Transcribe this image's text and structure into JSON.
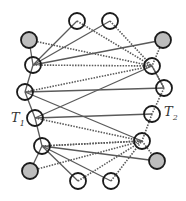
{
  "diagram": {
    "labels": {
      "t1": {
        "main": "T",
        "sub": "1"
      },
      "t2": {
        "main": "T",
        "sub": "2"
      }
    },
    "colors": {
      "stroke": "#1a1a1a",
      "edge": "#5a5a5a",
      "fill_hatched": "#bdbdbd",
      "fill_plain": "#ffffff"
    },
    "nodes": [
      {
        "id": "tl",
        "x": 29,
        "y": 40,
        "filled": true
      },
      {
        "id": "top1",
        "x": 77,
        "y": 21,
        "filled": false
      },
      {
        "id": "top2",
        "x": 110,
        "y": 21,
        "filled": false
      },
      {
        "id": "tr",
        "x": 163,
        "y": 40,
        "filled": true
      },
      {
        "id": "L1",
        "x": 33,
        "y": 65,
        "filled": false
      },
      {
        "id": "R1",
        "x": 152,
        "y": 66,
        "filled": false
      },
      {
        "id": "L2",
        "x": 25,
        "y": 92,
        "filled": false
      },
      {
        "id": "R2",
        "x": 164,
        "y": 88,
        "filled": false
      },
      {
        "id": "T1",
        "x": 35,
        "y": 118,
        "filled": false
      },
      {
        "id": "T2",
        "x": 152,
        "y": 114,
        "filled": false
      },
      {
        "id": "L3",
        "x": 42,
        "y": 146,
        "filled": false
      },
      {
        "id": "R3",
        "x": 142,
        "y": 141,
        "filled": false
      },
      {
        "id": "bl",
        "x": 30,
        "y": 171,
        "filled": true
      },
      {
        "id": "br",
        "x": 157,
        "y": 161,
        "filled": true
      },
      {
        "id": "bot1",
        "x": 78,
        "y": 181,
        "filled": false
      },
      {
        "id": "bot2",
        "x": 111,
        "y": 181,
        "filled": false
      }
    ],
    "solid_edges": [
      [
        "tl",
        "L1"
      ],
      [
        "L1",
        "L2"
      ],
      [
        "L2",
        "T1"
      ],
      [
        "T1",
        "L3"
      ],
      [
        "L3",
        "bl"
      ],
      [
        "L1",
        "top1"
      ],
      [
        "L1",
        "top2"
      ],
      [
        "L1",
        "tr"
      ],
      [
        "L2",
        "R3"
      ],
      [
        "L2",
        "R2"
      ],
      [
        "T1",
        "R1"
      ],
      [
        "T1",
        "T2"
      ],
      [
        "L3",
        "bot1"
      ],
      [
        "L3",
        "bot2"
      ],
      [
        "L3",
        "br"
      ],
      [
        "R1",
        "R2"
      ]
    ],
    "dotted_edges": [
      [
        "tl",
        "R1"
      ],
      [
        "top1",
        "R1"
      ],
      [
        "top2",
        "R1"
      ],
      [
        "tr",
        "R1"
      ],
      [
        "L1",
        "R1"
      ],
      [
        "L2",
        "R1"
      ],
      [
        "R1",
        "R2"
      ],
      [
        "R2",
        "T2"
      ],
      [
        "T2",
        "R3"
      ],
      [
        "R3",
        "br"
      ],
      [
        "T1",
        "R3"
      ],
      [
        "L3",
        "R3"
      ],
      [
        "bl",
        "R3"
      ],
      [
        "bot1",
        "R3"
      ],
      [
        "bot2",
        "R3"
      ],
      [
        "L3",
        "R3"
      ]
    ]
  }
}
